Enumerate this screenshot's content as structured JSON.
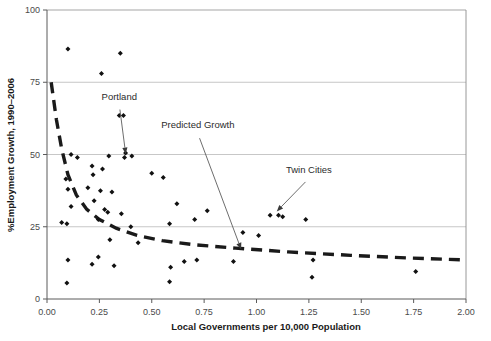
{
  "chart_data": {
    "type": "scatter",
    "title": "",
    "xlabel": "Local Governments per 10,000 Population",
    "ylabel": "%Employment Growth, 1990–2006",
    "xlim": [
      0.0,
      2.0
    ],
    "ylim": [
      0,
      100
    ],
    "xticks": [
      0.0,
      0.25,
      0.5,
      0.75,
      1.0,
      1.25,
      1.5,
      1.75,
      2.0
    ],
    "xtick_labels": [
      "0.00",
      "0.25",
      "0.50",
      "0.75",
      "1.00",
      "1.25",
      "1.50",
      "1.75",
      "2.00"
    ],
    "yticks": [
      0,
      25,
      50,
      75,
      100
    ],
    "ytick_labels": [
      "0",
      "25",
      "50",
      "75",
      "100"
    ],
    "grid": "horizontal",
    "legend": "none",
    "marker": "diamond",
    "marker_color": "#111111",
    "points": [
      {
        "x": 0.1,
        "y": 86.5
      },
      {
        "x": 0.35,
        "y": 85.0
      },
      {
        "x": 0.26,
        "y": 78.0
      },
      {
        "x": 0.345,
        "y": 63.5
      },
      {
        "x": 0.365,
        "y": 63.5
      },
      {
        "x": 0.295,
        "y": 49.5
      },
      {
        "x": 0.375,
        "y": 50.5
      },
      {
        "x": 0.405,
        "y": 49.5
      },
      {
        "x": 0.115,
        "y": 50.0
      },
      {
        "x": 0.145,
        "y": 49.0
      },
      {
        "x": 0.215,
        "y": 46.0
      },
      {
        "x": 0.265,
        "y": 45.0
      },
      {
        "x": 0.22,
        "y": 43.0
      },
      {
        "x": 0.37,
        "y": 49.0
      },
      {
        "x": 0.5,
        "y": 43.5
      },
      {
        "x": 0.555,
        "y": 42.0
      },
      {
        "x": 0.09,
        "y": 41.5
      },
      {
        "x": 0.1,
        "y": 38.0
      },
      {
        "x": 0.195,
        "y": 38.5
      },
      {
        "x": 0.255,
        "y": 37.5
      },
      {
        "x": 0.31,
        "y": 37.0
      },
      {
        "x": 0.225,
        "y": 34.0
      },
      {
        "x": 0.115,
        "y": 32.0
      },
      {
        "x": 0.62,
        "y": 33.0
      },
      {
        "x": 0.765,
        "y": 30.5
      },
      {
        "x": 0.585,
        "y": 26.0
      },
      {
        "x": 0.705,
        "y": 27.5
      },
      {
        "x": 0.275,
        "y": 31.0
      },
      {
        "x": 0.29,
        "y": 30.0
      },
      {
        "x": 0.355,
        "y": 29.5
      },
      {
        "x": 0.245,
        "y": 27.5
      },
      {
        "x": 0.07,
        "y": 26.5
      },
      {
        "x": 0.095,
        "y": 26.0
      },
      {
        "x": 0.4,
        "y": 25.0
      },
      {
        "x": 1.065,
        "y": 29.0
      },
      {
        "x": 1.105,
        "y": 29.0
      },
      {
        "x": 1.125,
        "y": 28.5
      },
      {
        "x": 1.235,
        "y": 27.5
      },
      {
        "x": 0.935,
        "y": 23.0
      },
      {
        "x": 1.01,
        "y": 22.0
      },
      {
        "x": 0.3,
        "y": 20.5
      },
      {
        "x": 0.435,
        "y": 19.5
      },
      {
        "x": 0.1,
        "y": 13.5
      },
      {
        "x": 0.215,
        "y": 12.0
      },
      {
        "x": 0.245,
        "y": 14.5
      },
      {
        "x": 0.32,
        "y": 11.5
      },
      {
        "x": 0.59,
        "y": 11.0
      },
      {
        "x": 0.655,
        "y": 13.0
      },
      {
        "x": 0.715,
        "y": 13.5
      },
      {
        "x": 0.89,
        "y": 13.0
      },
      {
        "x": 1.27,
        "y": 13.5
      },
      {
        "x": 1.265,
        "y": 7.5
      },
      {
        "x": 0.585,
        "y": 6.0
      },
      {
        "x": 0.095,
        "y": 5.5
      },
      {
        "x": 1.76,
        "y": 9.5
      }
    ],
    "trend_line": {
      "name": "Predicted Growth",
      "style": "dashed",
      "color": "#1a1a1a",
      "points": [
        {
          "x": 0.02,
          "y": 75.0
        },
        {
          "x": 0.045,
          "y": 62.0
        },
        {
          "x": 0.07,
          "y": 52.0
        },
        {
          "x": 0.1,
          "y": 43.0
        },
        {
          "x": 0.14,
          "y": 36.0
        },
        {
          "x": 0.19,
          "y": 31.0
        },
        {
          "x": 0.25,
          "y": 27.5
        },
        {
          "x": 0.33,
          "y": 24.5
        },
        {
          "x": 0.43,
          "y": 22.0
        },
        {
          "x": 0.55,
          "y": 20.2
        },
        {
          "x": 0.7,
          "y": 18.8
        },
        {
          "x": 0.9,
          "y": 17.6
        },
        {
          "x": 1.15,
          "y": 16.3
        },
        {
          "x": 1.45,
          "y": 15.1
        },
        {
          "x": 1.72,
          "y": 14.2
        },
        {
          "x": 2.0,
          "y": 13.5
        }
      ]
    },
    "annotations": [
      {
        "label": "Portland",
        "label_x": 0.345,
        "label_y": 69.0,
        "target_x": 0.375,
        "target_y": 50.5,
        "arrow": true
      },
      {
        "label": "Predicted Growth",
        "label_x": 0.72,
        "label_y": 59.0,
        "target_x": 0.925,
        "target_y": 17.5,
        "arrow": true
      },
      {
        "label": "Twin Cities",
        "label_x": 1.25,
        "label_y": 43.5,
        "target_x": 1.1,
        "target_y": 30.5,
        "arrow": true
      }
    ]
  }
}
